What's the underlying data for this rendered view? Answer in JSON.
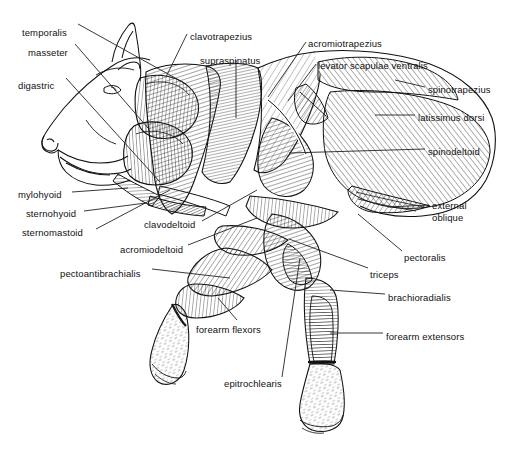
{
  "figure": {
    "view": "left lateral",
    "background_color": "#ffffff",
    "line_color": "#111111",
    "leader_color": "#222222"
  },
  "labels": [
    {
      "id": "temporalis",
      "text": "temporalis",
      "x": 22,
      "y": 27,
      "align": "left",
      "leader": [
        [
          78,
          24
        ],
        [
          186,
          84
        ]
      ]
    },
    {
      "id": "masseter",
      "text": "masseter",
      "x": 28,
      "y": 47,
      "align": "left",
      "leader": [
        [
          75,
          44
        ],
        [
          148,
          128
        ]
      ]
    },
    {
      "id": "digastric",
      "text": "digastric",
      "x": 18,
      "y": 80,
      "align": "left",
      "leader": [
        [
          66,
          78
        ],
        [
          160,
          182
        ]
      ]
    },
    {
      "id": "clavotrapezius",
      "text": "clavotrapezius",
      "x": 190,
      "y": 31,
      "align": "left",
      "leader": [
        [
          187,
          34
        ],
        [
          166,
          77
        ]
      ]
    },
    {
      "id": "supraspinatus",
      "text": "supraspinatus",
      "x": 200,
      "y": 55,
      "align": "left",
      "leader": [
        [
          236,
          60
        ],
        [
          236,
          118
        ]
      ]
    },
    {
      "id": "acromiotrapezius",
      "text": "acromiotrapezius",
      "x": 308,
      "y": 38,
      "align": "left",
      "leader": [
        [
          306,
          42
        ],
        [
          268,
          97
        ]
      ]
    },
    {
      "id": "levator-scapulae-ventralis",
      "text": "levator scapulae ventralis",
      "x": 318,
      "y": 60,
      "align": "left",
      "leader": [
        [
          316,
          64
        ],
        [
          288,
          101
        ]
      ]
    },
    {
      "id": "spinotrapezius",
      "text": "spinotrapezius",
      "x": 428,
      "y": 84,
      "align": "left",
      "leader": [
        [
          425,
          87
        ],
        [
          395,
          80
        ]
      ]
    },
    {
      "id": "latissimus-dorsi",
      "text": "latissimus dorsi",
      "x": 418,
      "y": 112,
      "align": "left",
      "leader": [
        [
          415,
          115
        ],
        [
          375,
          115
        ]
      ]
    },
    {
      "id": "spinodeltoid",
      "text": "spinodeltoid",
      "x": 428,
      "y": 146,
      "align": "left",
      "leader": [
        [
          425,
          149
        ],
        [
          289,
          153
        ]
      ]
    },
    {
      "id": "external-oblique",
      "text": "external\noblique",
      "x": 432,
      "y": 200,
      "align": "left",
      "leader": [
        [
          429,
          205
        ],
        [
          388,
          207
        ]
      ]
    },
    {
      "id": "pectoralis",
      "text": "pectoralis",
      "x": 404,
      "y": 252,
      "align": "left",
      "leader": [
        [
          402,
          251
        ],
        [
          358,
          214
        ]
      ]
    },
    {
      "id": "triceps",
      "text": "triceps",
      "x": 370,
      "y": 269,
      "align": "left",
      "leader": [
        [
          368,
          268
        ],
        [
          289,
          239
        ]
      ]
    },
    {
      "id": "brachioradialis",
      "text": "brachioradialis",
      "x": 388,
      "y": 292,
      "align": "left",
      "leader": [
        [
          385,
          294
        ],
        [
          330,
          290
        ]
      ]
    },
    {
      "id": "forearm-extensors",
      "text": "forearm extensors",
      "x": 386,
      "y": 331,
      "align": "left",
      "leader": [
        [
          383,
          333
        ],
        [
          330,
          333
        ]
      ]
    },
    {
      "id": "mylohyoid",
      "text": "mylohyoid",
      "x": 18,
      "y": 189,
      "align": "left",
      "leader": [
        [
          72,
          192
        ],
        [
          128,
          188
        ]
      ]
    },
    {
      "id": "sternohyoid",
      "text": "sternohyoid",
      "x": 26,
      "y": 208,
      "align": "left",
      "leader": [
        [
          84,
          211
        ],
        [
          146,
          203
        ]
      ]
    },
    {
      "id": "sternomastoid",
      "text": "sternomastoid",
      "x": 22,
      "y": 227,
      "align": "left",
      "leader": [
        [
          96,
          229
        ],
        [
          170,
          190
        ]
      ]
    },
    {
      "id": "clavodeltoid",
      "text": "clavodeltoid",
      "x": 144,
      "y": 219,
      "align": "left",
      "leader": [
        [
          202,
          221
        ],
        [
          257,
          190
        ]
      ]
    },
    {
      "id": "acromiodeltoid",
      "text": "acromiodeltoid",
      "x": 120,
      "y": 244,
      "align": "left",
      "leader": [
        [
          188,
          245
        ],
        [
          257,
          218
        ]
      ]
    },
    {
      "id": "pectoantibrachialis",
      "text": "pectoantibrachialis",
      "x": 60,
      "y": 268,
      "align": "left",
      "leader": [
        [
          152,
          269
        ],
        [
          230,
          278
        ]
      ]
    },
    {
      "id": "forearm-flexors",
      "text": "forearm flexors",
      "x": 196,
      "y": 324,
      "align": "left",
      "leader": [
        [
          237,
          320
        ],
        [
          218,
          298
        ]
      ]
    },
    {
      "id": "epitrochlearis",
      "text": "epitrochlearis",
      "x": 224,
      "y": 378,
      "align": "left",
      "leader": [
        [
          282,
          377
        ],
        [
          300,
          258
        ]
      ]
    }
  ]
}
